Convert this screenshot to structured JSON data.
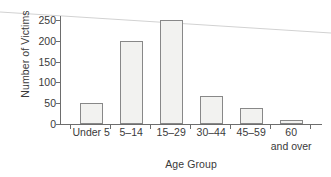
{
  "chart_data": {
    "type": "bar",
    "title": "",
    "subtitle": "",
    "xlabel": "Age Group",
    "ylabel": "Number of Victims",
    "categories": [
      "Under 5",
      "5–14",
      "15–29",
      "30–44",
      "45–59",
      "60 and over"
    ],
    "category_lines": [
      [
        "Under 5"
      ],
      [
        "5–14"
      ],
      [
        "15–29"
      ],
      [
        "30–44"
      ],
      [
        "45–59"
      ],
      [
        "60",
        "and over"
      ]
    ],
    "values": [
      50,
      200,
      250,
      68,
      38,
      10
    ],
    "ylim": [
      0,
      250
    ],
    "yticks": [
      0,
      50,
      100,
      150,
      200,
      250
    ],
    "ytick_labels": [
      "0",
      "50",
      "100",
      "150",
      "200",
      "250"
    ],
    "grid": false,
    "legend": null,
    "bar_fill": "#f2f2f0",
    "bar_stroke": "#888888",
    "axis_color": "#6d6d6d",
    "text_color": "#3a3a3a",
    "annotations": [
      {
        "name": "scan-artifact-line",
        "description": "faint diagonal gray line crossing the page",
        "color": "#d2d2d2",
        "x1": 0,
        "y1": 12,
        "x2": 331,
        "y2": 33
      }
    ]
  }
}
